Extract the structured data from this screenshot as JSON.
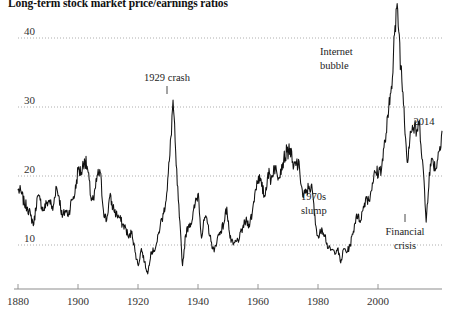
{
  "chart_data": {
    "type": "line",
    "title": "Long-term stock market price/earnings ratios",
    "xlabel": "",
    "ylabel": "",
    "xlim": [
      1880,
      2014
    ],
    "ylim": [
      0,
      46
    ],
    "grid": true,
    "legend": "none",
    "yticks": [
      "10",
      "20",
      "30",
      "40"
    ],
    "ytick_values": [
      10,
      20,
      30,
      40
    ],
    "xticks": [
      "1880",
      "1900",
      "1920",
      "1940",
      "1960",
      "1980",
      "2000"
    ],
    "xtick_values": [
      1880,
      1900,
      1920,
      1940,
      1960,
      1980,
      2000
    ],
    "series": [
      {
        "name": "Cyclically adjusted price/earnings ratio",
        "x": [
          1880,
          1881,
          1882,
          1883,
          1884,
          1885,
          1886,
          1887,
          1888,
          1889,
          1890,
          1891,
          1892,
          1893,
          1894,
          1895,
          1896,
          1897,
          1898,
          1899,
          1900,
          1901,
          1902,
          1903,
          1904,
          1905,
          1906,
          1907,
          1908,
          1909,
          1910,
          1911,
          1912,
          1913,
          1914,
          1915,
          1916,
          1917,
          1918,
          1919,
          1920,
          1921,
          1922,
          1923,
          1924,
          1925,
          1926,
          1927,
          1928,
          1929,
          1930,
          1931,
          1932,
          1933,
          1934,
          1935,
          1936,
          1937,
          1938,
          1939,
          1940,
          1941,
          1942,
          1943,
          1944,
          1945,
          1946,
          1947,
          1948,
          1949,
          1950,
          1951,
          1952,
          1953,
          1954,
          1955,
          1956,
          1957,
          1958,
          1959,
          1960,
          1961,
          1962,
          1963,
          1964,
          1965,
          1966,
          1967,
          1968,
          1969,
          1970,
          1971,
          1972,
          1973,
          1974,
          1975,
          1976,
          1977,
          1978,
          1979,
          1980,
          1981,
          1982,
          1983,
          1984,
          1985,
          1986,
          1987,
          1988,
          1989,
          1990,
          1991,
          1992,
          1993,
          1994,
          1995,
          1996,
          1997,
          1998,
          1999,
          2000,
          2001,
          2002,
          2003,
          2004,
          2005,
          2006,
          2007,
          2008,
          2009,
          2010,
          2011,
          2012,
          2013,
          2014
        ],
        "y": [
          18.0,
          17.6,
          16.0,
          15.5,
          14.2,
          13.0,
          16.8,
          16.5,
          15.0,
          16.0,
          16.5,
          15.0,
          18.5,
          17.0,
          14.0,
          15.0,
          14.5,
          16.5,
          17.5,
          21.0,
          20.5,
          22.5,
          21.0,
          17.0,
          16.5,
          20.0,
          20.5,
          15.0,
          13.5,
          17.0,
          15.5,
          14.5,
          14.0,
          13.0,
          12.5,
          11.0,
          12.0,
          9.0,
          7.0,
          9.5,
          7.5,
          5.8,
          9.0,
          9.2,
          10.5,
          13.0,
          14.5,
          17.5,
          23.0,
          31.0,
          21.5,
          14.0,
          7.0,
          11.5,
          13.0,
          13.5,
          16.0,
          17.5,
          11.0,
          14.0,
          13.0,
          10.5,
          9.0,
          11.0,
          12.0,
          13.0,
          15.5,
          11.0,
          10.0,
          10.5,
          11.0,
          12.5,
          13.5,
          13.0,
          14.5,
          18.0,
          20.0,
          18.5,
          17.0,
          20.5,
          19.5,
          21.5,
          20.0,
          21.0,
          22.5,
          23.5,
          24.0,
          21.0,
          22.0,
          21.0,
          17.0,
          17.5,
          18.5,
          18.0,
          13.0,
          11.0,
          12.5,
          11.5,
          9.5,
          9.3,
          9.0,
          9.5,
          7.4,
          9.5,
          9.0,
          10.0,
          12.0,
          14.5,
          13.5,
          15.0,
          17.0,
          16.5,
          19.0,
          20.5,
          20.5,
          21.5,
          25.0,
          28.5,
          33.0,
          40.5,
          44.2,
          36.0,
          30.0,
          22.0,
          26.5,
          27.0,
          26.5,
          27.3,
          21.5,
          13.3,
          20.5,
          22.5,
          21.0,
          23.5,
          26.5
        ]
      }
    ],
    "annotations": [
      {
        "label": "1929 crash",
        "x_year": 1929,
        "value": 31.0,
        "pointer": true
      },
      {
        "label": "Internet bubble",
        "x_year": 2000,
        "value": 44.2,
        "pointer": false
      },
      {
        "label": "1970s slump",
        "x_year": 1975,
        "value": 11.0,
        "pointer": false
      },
      {
        "label": "Financial crisis",
        "x_year": 2009,
        "value": 13.3,
        "pointer": true
      },
      {
        "label": "2014",
        "x_year": 2014,
        "value": 26.5,
        "pointer": false
      }
    ]
  },
  "chart": {
    "title": "Long-term stock market price/earnings ratios",
    "y_labels": {
      "y40": "40",
      "y30": "30",
      "y20": "20",
      "y10": "10"
    },
    "x_labels": {
      "x1880": "1880",
      "x1900": "1900",
      "x1920": "1920",
      "x1940": "1940",
      "x1960": "1960",
      "x1980": "1980",
      "x2000": "2000"
    },
    "annotations": {
      "crash_1929": "1929 crash",
      "internet_bubble_line1": "Internet",
      "internet_bubble_line2": "bubble",
      "slump_1970s_line1": "1970s",
      "slump_1970s_line2": "slump",
      "financial_crisis_line1": "Financial",
      "financial_crisis_line2": "crisis",
      "year_2014": "2014"
    },
    "colors": {
      "line": "#111111",
      "grid": "#9a9a9a",
      "axis": "#8d8d8d",
      "text": "#222222",
      "background": "#ffffff"
    }
  }
}
